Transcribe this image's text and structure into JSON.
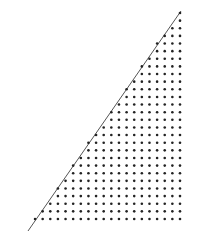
{
  "diagram": {
    "type": "dotted right triangle",
    "background": "#ffffff",
    "dot_color": "#222222",
    "line_color": "#555555",
    "hypotenuse": {
      "x1": 28,
      "y1": 231,
      "x2": 181,
      "y2": 11
    },
    "grid": {
      "right_x": 180,
      "top_y": 13,
      "bottom_y": 219,
      "rows": 28,
      "spacing": 7.63,
      "dot_radius": 1.3
    }
  }
}
